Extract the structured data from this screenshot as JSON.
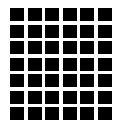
{
  "grid": {
    "columns": 6,
    "rows": 7,
    "cell_color": "#000000",
    "background_color": "#ffffff"
  }
}
